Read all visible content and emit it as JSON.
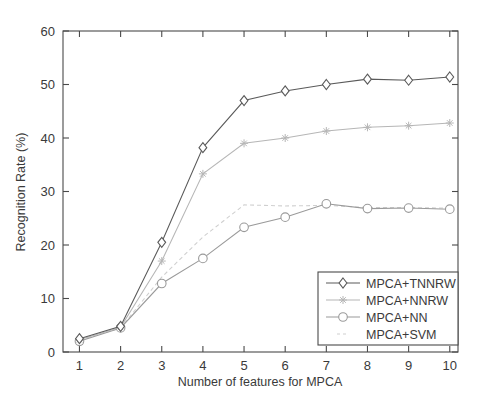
{
  "chart_data": {
    "type": "line",
    "title": "",
    "xlabel": "Number of features for MPCA",
    "ylabel": "Recognition Rate (%)",
    "x": [
      1,
      2,
      3,
      4,
      5,
      6,
      7,
      8,
      9,
      10
    ],
    "xlim": [
      0.6,
      10.2
    ],
    "ylim": [
      0,
      60
    ],
    "xticks": [
      1,
      2,
      3,
      4,
      5,
      6,
      7,
      8,
      9,
      10
    ],
    "yticks": [
      0,
      10,
      20,
      30,
      40,
      50,
      60
    ],
    "xtick_labels": [
      "1",
      "2",
      "3",
      "4",
      "5",
      "6",
      "7",
      "8",
      "9",
      "10"
    ],
    "ytick_labels": [
      "0",
      "10",
      "20",
      "30",
      "40",
      "50",
      "60"
    ],
    "grid": false,
    "legend_position": "lower right",
    "series": [
      {
        "name": "MPCA+TNNRW",
        "marker": "diamond",
        "color": "#5a5a5a",
        "linestyle": "solid",
        "values": [
          2.5,
          4.8,
          20.5,
          38.2,
          47.0,
          48.8,
          50.0,
          51.0,
          50.8,
          51.4
        ]
      },
      {
        "name": "MPCA+NNRW",
        "marker": "star",
        "color": "#b6b6b6",
        "linestyle": "solid",
        "values": [
          2.3,
          4.6,
          17.0,
          33.3,
          39.0,
          40.0,
          41.3,
          42.0,
          42.3,
          42.8
        ]
      },
      {
        "name": "MPCA+NN",
        "marker": "circle",
        "color": "#9a9a9a",
        "linestyle": "solid",
        "values": [
          2.0,
          4.5,
          12.8,
          17.5,
          23.3,
          25.2,
          27.7,
          26.8,
          26.9,
          26.7
        ]
      },
      {
        "name": "MPCA+SVM",
        "marker": "none",
        "color": "#cfcfcf",
        "linestyle": "dashed",
        "values": [
          2.2,
          4.5,
          14.0,
          21.5,
          27.5,
          27.3,
          27.4,
          27.0,
          27.0,
          26.9
        ]
      }
    ]
  },
  "axes": {
    "x_title": "Number of features for MPCA",
    "y_title": "Recognition Rate (%)"
  },
  "legend": {
    "items": [
      {
        "label": "MPCA+TNNRW"
      },
      {
        "label": "MPCA+NNRW"
      },
      {
        "label": "MPCA+NN"
      },
      {
        "label": "MPCA+SVM"
      }
    ]
  },
  "colors": {
    "axis": "#4a4a4a",
    "series_tnnrw": "#5a5a5a",
    "series_nnrw": "#b6b6b6",
    "series_nn": "#9a9a9a",
    "series_svm": "#cfcfcf",
    "background": "#ffffff"
  }
}
